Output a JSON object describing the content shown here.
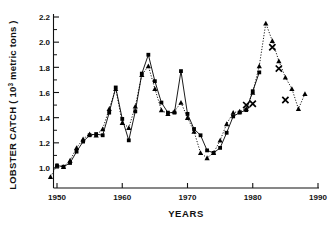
{
  "chart_data": {
    "type": "line",
    "title": "",
    "xlabel": "YEARS",
    "ylabel": "LOBSTER CATCH ( 10³ metric tons )",
    "ylabel_parts": {
      "pre": "LOBSTER CATCH ( 10",
      "sup": "3",
      "post": " metric tons )"
    },
    "xlim": [
      1948,
      1991
    ],
    "ylim": [
      0.88,
      2.28
    ],
    "grid": false,
    "legend": null,
    "x_ticks": [
      1950,
      1960,
      1970,
      1980,
      1990
    ],
    "x_tick_labels": [
      "1950",
      "1960",
      "1970",
      "1980",
      "1990"
    ],
    "y_ticks": [
      1.0,
      1.2,
      1.4,
      1.6,
      1.8,
      2.0,
      2.2
    ],
    "y_tick_labels": [
      "1.0",
      "1.2",
      "1.4",
      "1.6",
      "1.8",
      "2.0",
      "2.2"
    ],
    "y_minor_ticks": [
      1.1,
      1.3,
      1.5,
      1.7,
      1.9,
      2.1
    ],
    "series": [
      {
        "name": "solid-square-series",
        "marker": "filled-square",
        "line_style": "solid",
        "color": "#000000",
        "x": [
          1950,
          1951,
          1952,
          1953,
          1954,
          1955,
          1956,
          1957,
          1958,
          1959,
          1960,
          1961,
          1962,
          1963,
          1964,
          1965,
          1966,
          1967,
          1968,
          1969,
          1970,
          1971,
          1972,
          1973,
          1974,
          1975,
          1976,
          1977,
          1978,
          1979,
          1980,
          1981
        ],
        "values": [
          1.02,
          1.01,
          1.04,
          1.13,
          1.21,
          1.26,
          1.27,
          1.26,
          1.44,
          1.64,
          1.39,
          1.22,
          1.45,
          1.75,
          1.9,
          1.69,
          1.52,
          1.44,
          1.44,
          1.77,
          1.43,
          1.31,
          1.26,
          1.14,
          1.12,
          1.16,
          1.28,
          1.41,
          1.44,
          1.46,
          1.61,
          1.76
        ]
      },
      {
        "name": "dotted-triangle-series",
        "marker": "filled-triangle",
        "line_style": "dotted",
        "color": "#000000",
        "x": [
          1949,
          1950,
          1951,
          1952,
          1953,
          1954,
          1955,
          1956,
          1957,
          1958,
          1959,
          1960,
          1961,
          1962,
          1963,
          1964,
          1965,
          1966,
          1967,
          1968,
          1969,
          1970,
          1971,
          1972,
          1973,
          1974,
          1975,
          1976,
          1977,
          1978,
          1979,
          1980,
          1981,
          1982,
          1983,
          1984,
          1985,
          1986,
          1987,
          1988
        ],
        "values": [
          0.93,
          1.02,
          1.01,
          1.06,
          1.16,
          1.23,
          1.27,
          1.26,
          1.31,
          1.47,
          1.63,
          1.36,
          1.32,
          1.49,
          1.74,
          1.81,
          1.63,
          1.46,
          1.43,
          1.45,
          1.52,
          1.4,
          1.29,
          1.12,
          1.08,
          1.12,
          1.22,
          1.35,
          1.44,
          1.45,
          1.47,
          1.6,
          1.81,
          2.15,
          2.01,
          1.85,
          1.72,
          1.63,
          1.47,
          1.59
        ]
      },
      {
        "name": "cross-marker-series",
        "marker": "x-cross",
        "line_style": "none",
        "color": "#000000",
        "x": [
          1979,
          1980,
          1983,
          1984,
          1985
        ],
        "values": [
          1.5,
          1.51,
          1.96,
          1.79,
          1.54
        ]
      }
    ]
  }
}
